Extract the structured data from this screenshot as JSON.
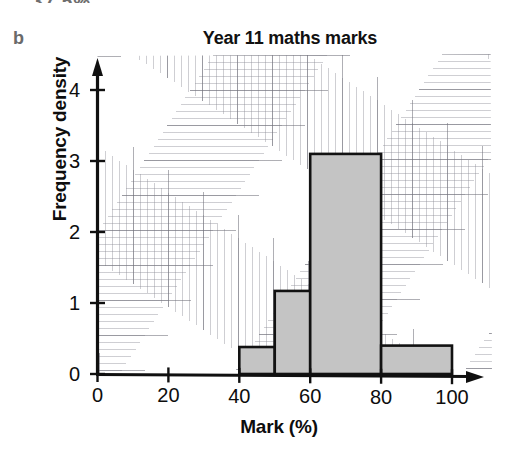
{
  "page": {
    "top_fragment_text": "= 37.5%",
    "part_label": "b"
  },
  "chart_data": {
    "type": "bar",
    "title": "Year 11 maths marks",
    "xlabel": "Mark (%)",
    "ylabel": "Frequency density",
    "xlim": [
      0,
      100
    ],
    "ylim": [
      0,
      4.5
    ],
    "grid": true,
    "legend": "none",
    "xticks": [
      0,
      20,
      40,
      60,
      80,
      100
    ],
    "xtick_labels": [
      "0",
      "20",
      "40",
      "60",
      "80",
      "100"
    ],
    "yticks": [
      0,
      1,
      2,
      3,
      4
    ],
    "ytick_labels": [
      "0",
      "1",
      "2",
      "3",
      "4"
    ],
    "bar_style": {
      "fill": "#c4c4c4",
      "edge": "#121212",
      "edge_width": 2.6
    },
    "bins": [
      {
        "label": "0-40",
        "x_start": 0,
        "x_end": 40,
        "value": 0.0
      },
      {
        "label": "40-50",
        "x_start": 40,
        "x_end": 50,
        "value": 0.38
      },
      {
        "label": "50-60",
        "x_start": 50,
        "x_end": 60,
        "value": 1.17
      },
      {
        "label": "60-80",
        "x_start": 60,
        "x_end": 80,
        "value": 3.1
      },
      {
        "label": "80-100",
        "x_start": 80,
        "x_end": 100,
        "value": 0.4
      }
    ],
    "categories": [
      "0-40",
      "40-50",
      "50-60",
      "60-80",
      "80-100"
    ],
    "values": [
      0.0,
      0.38,
      1.17,
      3.1,
      0.4
    ]
  }
}
